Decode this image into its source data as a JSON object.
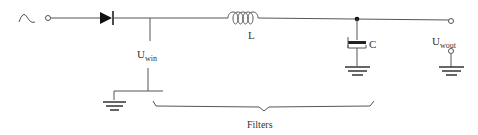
{
  "diagram": {
    "type": "rectifier-filter circuit",
    "components": {
      "source": {
        "symbol": "ac-source-icon"
      },
      "diode": {
        "symbol": "diode"
      },
      "inductor": {
        "label": "L"
      },
      "capacitor": {
        "label": "C",
        "polarized": true
      },
      "input_voltage": {
        "label_main": "U",
        "label_sub": "win"
      },
      "output_voltage": {
        "label_main": "U",
        "label_sub": "wout"
      }
    },
    "brace": {
      "label": "Filters"
    }
  }
}
